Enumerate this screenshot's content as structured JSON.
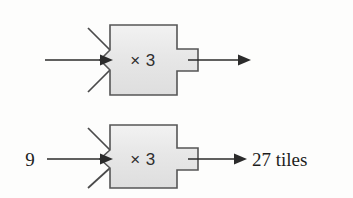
{
  "diagram": {
    "type": "function-machine-diagram",
    "background_color": "#fdfdfc",
    "box_fill_color": "#e9e9e9",
    "box_stroke_color": "#555555",
    "arrow_color": "#2b2b2b",
    "machines": [
      {
        "id": "machine-top",
        "operation_label": "× 3",
        "input_label": "",
        "output_label": "",
        "has_input_arrow": true,
        "has_output_arrow": true
      },
      {
        "id": "machine-bottom",
        "operation_label": "× 3",
        "input_label": "9",
        "output_label": "27 tiles",
        "has_input_arrow": true,
        "has_output_arrow": true
      }
    ]
  }
}
